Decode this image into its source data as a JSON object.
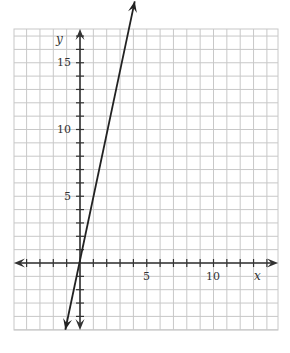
{
  "chart_data": {
    "type": "line",
    "title": "",
    "xlabel": "x",
    "ylabel": "y",
    "xlim": [
      -5,
      14.8
    ],
    "ylim": [
      -5,
      22.6
    ],
    "grid": true,
    "x_tick_labels": [
      "5",
      "10"
    ],
    "y_tick_labels": [
      "5",
      "10",
      "15"
    ],
    "series": [
      {
        "name": "line",
        "equation": "y ≈ 5x + 1",
        "x": [
          -1.1,
          4.1
        ],
        "y": [
          -5,
          19.6
        ],
        "arrows": "both"
      }
    ]
  },
  "labels": {
    "x_axis": "x",
    "y_axis": "y",
    "x5": "5",
    "x10": "10",
    "y5": "5",
    "y10": "10",
    "y15": "15"
  },
  "colors": {
    "grid": "#c8c8c8",
    "axis": "#333333",
    "line": "#222222"
  }
}
